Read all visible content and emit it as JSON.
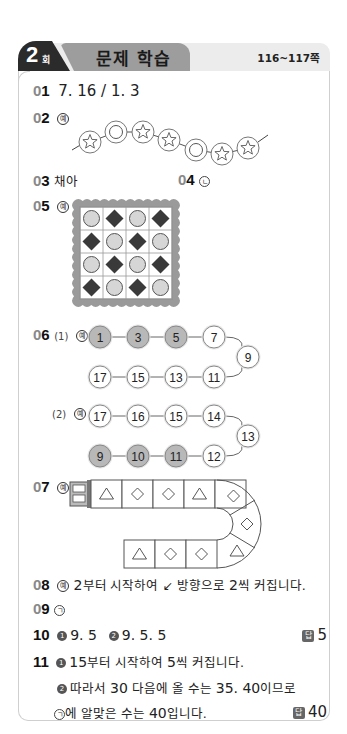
{
  "header": {
    "round_number": "2",
    "round_suffix": "회",
    "title": "문제 학습",
    "pages": "116~117쪽"
  },
  "example_mark": "예",
  "answer_mark": "답",
  "questions": {
    "q01": {
      "num_prefix": "0",
      "num": "1",
      "answer": "7. 16 / 1. 3"
    },
    "q02": {
      "num_prefix": "0",
      "num": "2",
      "beads": [
        "star",
        "circle",
        "star",
        "star",
        "circle",
        "star",
        "star"
      ]
    },
    "q03": {
      "num_prefix": "0",
      "num": "3",
      "answer": "채아"
    },
    "q04": {
      "num_prefix": "0",
      "num": "4",
      "answer": "ㄴ"
    },
    "q05": {
      "num_prefix": "0",
      "num": "5",
      "grid": [
        [
          "circle",
          "diamond",
          "circle",
          "diamond"
        ],
        [
          "diamond",
          "circle",
          "diamond",
          "circle"
        ],
        [
          "circle",
          "diamond",
          "circle",
          "diamond"
        ],
        [
          "diamond",
          "circle",
          "diamond",
          "circle"
        ]
      ]
    },
    "q06": {
      "num_prefix": "0",
      "num": "6",
      "part1": {
        "label": "(1)",
        "top_row": [
          "1",
          "3",
          "5",
          "7"
        ],
        "turn": "9",
        "bottom_row": [
          "17",
          "15",
          "13",
          "11"
        ],
        "shaded": [
          "1",
          "3",
          "5"
        ]
      },
      "part2": {
        "label": "(2)",
        "top_row": [
          "17",
          "16",
          "15",
          "14"
        ],
        "turn": "13",
        "bottom_row": [
          "9",
          "10",
          "11",
          "12"
        ],
        "shaded": [
          "9",
          "10",
          "11"
        ]
      }
    },
    "q07": {
      "num_prefix": "0",
      "num": "7",
      "top_row": [
        "triangle",
        "diamond",
        "diamond",
        "triangle",
        "diamond"
      ],
      "curve_middle": "diamond",
      "curve_bottom": "triangle",
      "bottom_row": [
        "triangle",
        "diamond",
        "diamond"
      ]
    },
    "q08": {
      "num_prefix": "0",
      "num": "8",
      "text_a": "2",
      "text_b": "부터 시작하여 ",
      "arrow": "↙",
      "text_c": " 방향으로 ",
      "text_d": "2",
      "text_e": "씩 커집니다."
    },
    "q09": {
      "num_prefix": "0",
      "num": "9",
      "answer": "ㄱ"
    },
    "q10": {
      "num": "10",
      "step1_bullet": "1",
      "step1": "9. 5",
      "step2_bullet": "2",
      "step2": "9. 5. 5",
      "final": "5"
    },
    "q11": {
      "num": "11",
      "step1_bullet": "1",
      "step1_a": "15",
      "step1_b": "부터 시작하여 ",
      "step1_c": "5",
      "step1_d": "씩 커집니다.",
      "step2_bullet": "2",
      "step2_a": "따라서 ",
      "step2_b": "30",
      "step2_c": " 다음에 올 수는 ",
      "step2_d": "35. 40",
      "step2_e": "이므로",
      "step3_sym": "ㄱ",
      "step3_a": "에 알맞은 수는 ",
      "step3_b": "40",
      "step3_c": "입니다.",
      "final": "40"
    }
  },
  "colors": {
    "header_tab": "#9d9d9d",
    "header_bar": "#ececec",
    "round_badge": "#2b2b2b",
    "shaded_bead": "#b8b8b8",
    "diamond_fill": "#3a3a3a",
    "circle_fill": "#d6d6d6",
    "stamp_border": "#9a9a9a",
    "card_border": "#cfcfcf"
  }
}
